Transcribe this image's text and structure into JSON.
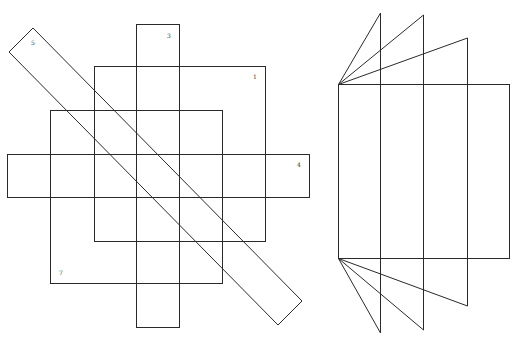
{
  "diagram": {
    "left_figure": {
      "shapes": [
        {
          "id": "rect-1",
          "label": "1"
        },
        {
          "id": "rect-3",
          "label": "3"
        },
        {
          "id": "rect-4",
          "label": "4"
        },
        {
          "id": "rect-5",
          "label": "5"
        },
        {
          "id": "rect-7",
          "label": "7"
        }
      ]
    },
    "right_figure": {
      "panel_count": 4,
      "top_triangles": 3,
      "bottom_triangles": 3
    },
    "stroke_color": "#2a2a2a",
    "background_color": "#ffffff"
  }
}
